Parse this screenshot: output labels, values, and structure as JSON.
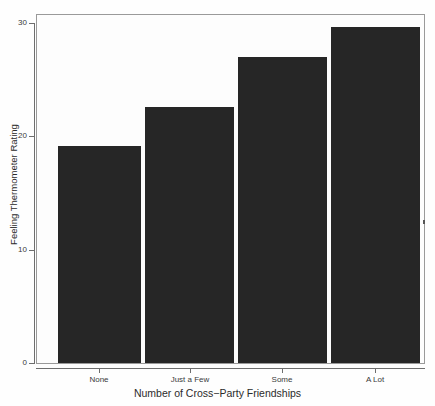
{
  "chart_data": {
    "type": "bar",
    "title": "",
    "subtitle": "",
    "xlabel": "Number of Cross−Party Friendships",
    "ylabel": "Feeling Thermometer Rating",
    "categories": [
      "None",
      "Just a Few",
      "Some",
      "A Lot"
    ],
    "values": [
      19.1,
      22.5,
      26.9,
      29.6
    ],
    "ylim": [
      0,
      30.7
    ],
    "yticks": [
      0,
      10,
      20,
      30
    ],
    "ytick_labels": [
      "0",
      "10",
      "20",
      "30"
    ],
    "grid": false,
    "legend": null,
    "legend_position": "none",
    "series": [
      {
        "name": "Feeling Thermometer Rating",
        "values": [
          19.1,
          22.5,
          26.9,
          29.6
        ]
      }
    ],
    "bar_color": "#262626",
    "background_color": "#fefefe",
    "frame_color": "#9a9a9a",
    "axis_color": "#6e6e6e"
  },
  "axes": {
    "y_title": "Feeling Thermometer Rating",
    "x_title": "Number of Cross−Party Friendships",
    "y_ticks": [
      {
        "label": "30",
        "value": 30
      },
      {
        "label": "20",
        "value": 20
      },
      {
        "label": "10",
        "value": 10
      },
      {
        "label": "0",
        "value": 0
      }
    ],
    "x_ticks": [
      {
        "label": "None"
      },
      {
        "label": "Just a Few"
      },
      {
        "label": "Some"
      },
      {
        "label": "A Lot"
      }
    ]
  },
  "bars": [
    {
      "category": "None",
      "value": 19.1
    },
    {
      "category": "Just a Few",
      "value": 22.5
    },
    {
      "category": "Some",
      "value": 26.9
    },
    {
      "category": "A Lot",
      "value": 29.6
    }
  ]
}
